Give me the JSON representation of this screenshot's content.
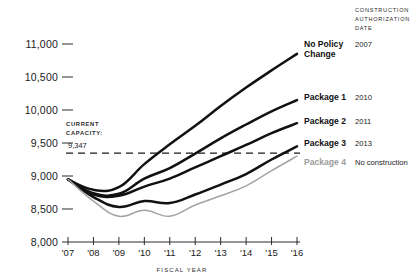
{
  "chart_data": {
    "type": "line",
    "title": "",
    "xlabel": "FISCAL YEAR",
    "ylabel": "",
    "x": [
      "'07",
      "'08",
      "'09",
      "'10",
      "'11",
      "'12",
      "'13",
      "'14",
      "'15",
      "'16"
    ],
    "ylim": [
      8000,
      11000
    ],
    "ytick_values": [
      8000,
      8500,
      9000,
      9500,
      10000,
      10500,
      11000
    ],
    "ytick_labels": [
      "8,000",
      "8,500",
      "9,000",
      "9,500",
      "10,000",
      "10,500",
      "11,000"
    ],
    "grid": false,
    "legend_position": "right",
    "series": [
      {
        "name": "No Policy Change",
        "authorization_date": "2007",
        "color": "#111111",
        "values": [
          8950,
          8790,
          8830,
          9180,
          9480,
          9760,
          10060,
          10340,
          10600,
          10850
        ]
      },
      {
        "name": "Package 1",
        "authorization_date": "2010",
        "color": "#111111",
        "values": [
          8950,
          8740,
          8730,
          8960,
          9120,
          9340,
          9570,
          9780,
          9980,
          10150
        ]
      },
      {
        "name": "Package 2",
        "authorization_date": "2011",
        "color": "#111111",
        "values": [
          8950,
          8720,
          8700,
          8840,
          8960,
          9130,
          9300,
          9470,
          9650,
          9800
        ]
      },
      {
        "name": "Package 3",
        "authorization_date": "2013",
        "color": "#111111",
        "values": [
          8950,
          8680,
          8530,
          8620,
          8590,
          8720,
          8870,
          9030,
          9250,
          9450
        ]
      },
      {
        "name": "Package 4",
        "authorization_date": "No construction",
        "color": "#a3a3a3",
        "values": [
          8950,
          8620,
          8390,
          8480,
          8390,
          8560,
          8700,
          8850,
          9080,
          9300
        ]
      }
    ],
    "annotations": [
      {
        "id": "current-capacity",
        "label_line1": "CURRENT",
        "label_line2": "CAPACITY:",
        "value_label": "9,347",
        "value": 9347,
        "style": "dashed-horizontal-line"
      }
    ],
    "legend_column_header": "CONSTRUCTION AUTHORIZATION DATE",
    "legend_column_header_lines": [
      "CONSTRUCTION",
      "AUTHORIZATION",
      "DATE"
    ]
  }
}
